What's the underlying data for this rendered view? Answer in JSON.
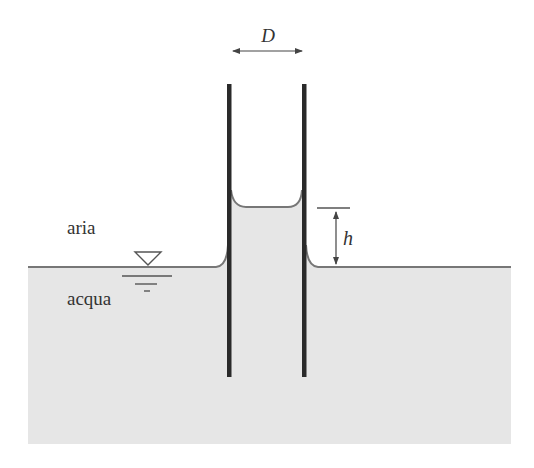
{
  "diagram": {
    "labels": {
      "diameter": "D",
      "height": "h",
      "air": "aria",
      "water": "acqua"
    },
    "symbols": {
      "free_surface": "free-surface-triangle-icon"
    },
    "colors": {
      "background": "#ffffff",
      "water": "#e6e6e6",
      "tube_wall": "#2a2a2a",
      "surface_line": "#777777",
      "annotation": "#444444"
    }
  }
}
